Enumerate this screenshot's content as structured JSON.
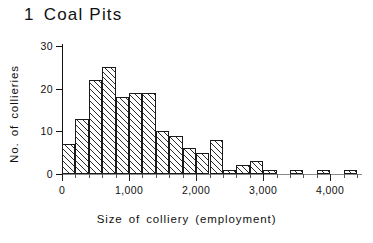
{
  "title": {
    "number": "1",
    "text": "Coal Pits"
  },
  "chart_data": {
    "type": "bar",
    "xlabel": "Size of colliery (employment)",
    "ylabel": "No. of collieries",
    "xlim": [
      0,
      4400
    ],
    "ylim": [
      0,
      30
    ],
    "bin_width": 200,
    "grid": false,
    "legend": null,
    "xticks": [
      0,
      1000,
      2000,
      3000,
      4000
    ],
    "xtick_labels": [
      "0",
      "1,000",
      "2,000",
      "3,000",
      "4,000"
    ],
    "xminor_step": 200,
    "yticks": [
      0,
      10,
      20,
      30
    ],
    "ytick_labels": [
      "0",
      "10",
      "20",
      "30"
    ],
    "bin_starts": [
      0,
      200,
      400,
      600,
      800,
      1000,
      1200,
      1400,
      1600,
      1800,
      2000,
      2200,
      2400,
      2600,
      2800,
      3000,
      3200,
      3400,
      3600,
      3800,
      4000,
      4200
    ],
    "categories": [
      "0-200",
      "200-400",
      "400-600",
      "600-800",
      "800-1,000",
      "1,000-1,200",
      "1,200-1,400",
      "1,400-1,600",
      "1,600-1,800",
      "1,800-2,000",
      "2,000-2,200",
      "2,200-2,400",
      "2,400-2,600",
      "2,600-2,800",
      "2,800-3,000",
      "3,000-3,200",
      "3,200-3,400",
      "3,400-3,600",
      "3,600-3,800",
      "3,800-4,000",
      "4,000-4,200",
      "4,200-4,400"
    ],
    "values": [
      7,
      13,
      22,
      25,
      18,
      19,
      19,
      10,
      9,
      6,
      5,
      8,
      1,
      2,
      3,
      1,
      0,
      1,
      0,
      1,
      0,
      1
    ],
    "bar_style": "hatched-45",
    "line_color": "#1a1a1a"
  }
}
